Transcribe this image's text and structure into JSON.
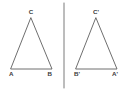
{
  "figure": {
    "background_color": "#ffffff",
    "stroke_color": "#5d5d5d",
    "label_color": "#3a3a3a",
    "mirror_line_color": "#7a7a7a",
    "canvas": {
      "width": 131,
      "height": 92
    },
    "mirror_line": {
      "x": 64,
      "y_top": 3,
      "y_bottom": 88
    },
    "shapes": [
      {
        "name": "left-triangle",
        "points": "11,69 52,69 31,18",
        "vertices": [
          {
            "id": "A",
            "label": "A",
            "x": 11,
            "y": 69,
            "label_x": 9,
            "label_y": 76,
            "anchor": "start"
          },
          {
            "id": "B",
            "label": "B",
            "x": 52,
            "y": 69,
            "label_x": 52,
            "label_y": 76,
            "anchor": "end"
          },
          {
            "id": "C",
            "label": "C",
            "x": 31,
            "y": 18,
            "label_x": 31,
            "label_y": 14,
            "anchor": "middle"
          }
        ]
      },
      {
        "name": "right-triangle",
        "points": "76,69 117,69 96,18",
        "vertices": [
          {
            "id": "Bp",
            "label": "B'",
            "x": 76,
            "y": 69,
            "label_x": 74,
            "label_y": 76,
            "anchor": "start"
          },
          {
            "id": "Ap",
            "label": "A'",
            "x": 117,
            "y": 69,
            "label_x": 118,
            "label_y": 76,
            "anchor": "end"
          },
          {
            "id": "Cp",
            "label": "C'",
            "x": 96,
            "y": 18,
            "label_x": 96,
            "label_y": 14,
            "anchor": "middle"
          }
        ]
      }
    ]
  }
}
